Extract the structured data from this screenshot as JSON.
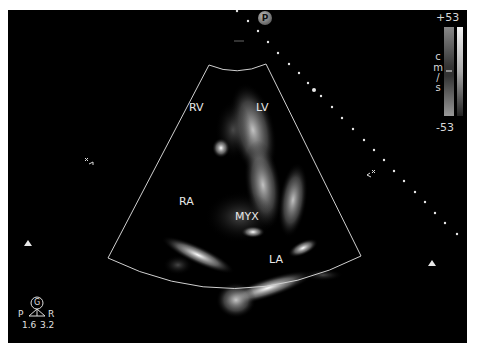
{
  "viewer": {
    "background": "#000000",
    "border": "#ffffff"
  },
  "chambers": {
    "rv": "RV",
    "lv": "LV",
    "ra": "RA",
    "myx": "MYX",
    "la": "LA"
  },
  "color_scale": {
    "max": "+53",
    "min": "-53",
    "unit_chars": [
      "c",
      "m",
      "/",
      "s"
    ]
  },
  "probe_marker": "P",
  "orientation": {
    "gain_label": "G",
    "left": "P",
    "right": "R",
    "left_value": "1.6",
    "right_value": "3.2"
  },
  "icons": {
    "focus_left": "focus-marker-icon",
    "focus_right": "focus-marker-icon",
    "triangle_left": "depth-triangle-icon",
    "triangle_right": "depth-triangle-icon"
  }
}
